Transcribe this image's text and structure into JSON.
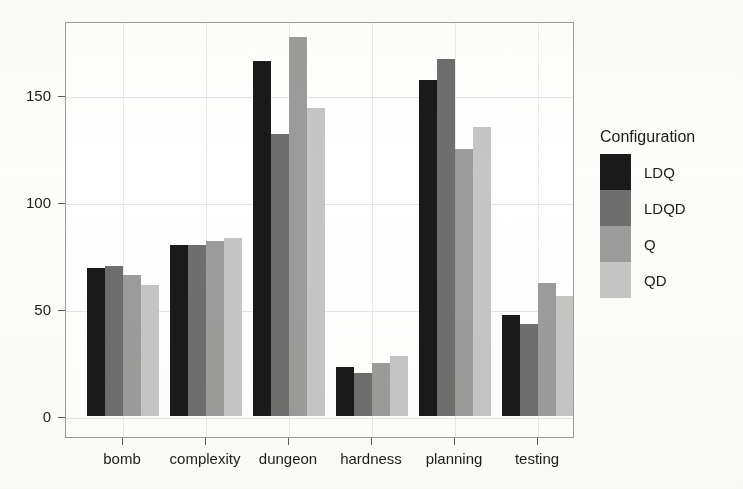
{
  "chart_data": {
    "type": "bar",
    "title": "",
    "xlabel": "",
    "ylabel": "",
    "ylim": [
      0,
      180
    ],
    "yticks": [
      0,
      50,
      100,
      150
    ],
    "ytick_labels": [
      "0",
      "50",
      "100",
      "150"
    ],
    "grid": true,
    "legend_position": "right",
    "legend_title": "Configuration",
    "categories": [
      "bomb",
      "complexity",
      "dungeon",
      "hardness",
      "planning",
      "testing"
    ],
    "series": [
      {
        "name": "LDQ",
        "color": "#1a1a1a",
        "values": [
          69,
          80,
          166,
          23,
          157,
          47
        ]
      },
      {
        "name": "LDQD",
        "color": "#6e6e6e",
        "values": [
          70,
          80,
          132,
          20,
          167,
          43
        ]
      },
      {
        "name": "Q",
        "color": "#9c9c9c",
        "values": [
          66,
          82,
          177,
          25,
          125,
          62
        ]
      },
      {
        "name": "QD",
        "color": "#c6c6c6",
        "values": [
          61,
          83,
          144,
          28,
          135,
          56
        ]
      }
    ]
  },
  "legend": {
    "title": "Configuration",
    "entries": [
      {
        "label": "LDQ",
        "color": "#1a1a1a"
      },
      {
        "label": "LDQD",
        "color": "#6e6e6e"
      },
      {
        "label": "Q",
        "color": "#9c9c9c"
      },
      {
        "label": "QD",
        "color": "#c6c6c6"
      }
    ]
  },
  "axes": {
    "y_tick_labels": [
      "150",
      "100",
      "50",
      "0"
    ],
    "x_tick_labels": [
      "bomb",
      "complexity",
      "dungeon",
      "hardness",
      "planning",
      "testing"
    ]
  }
}
